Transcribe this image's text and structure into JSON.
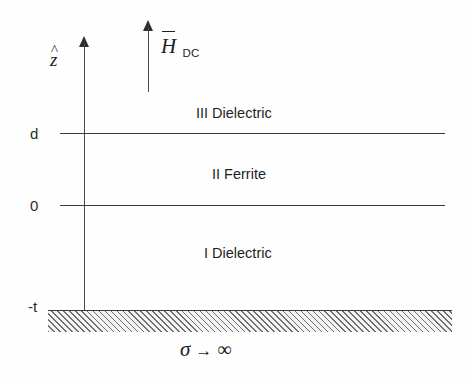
{
  "figure": {
    "type": "physics-layered-structure-diagram",
    "width": 470,
    "height": 381,
    "background_color": "#fefefe",
    "line_color": "#3a3a3a"
  },
  "axis": {
    "vertical_axis_symbol": "z",
    "vertical_axis_accent": "^",
    "vertical_axis_full": "ẑ",
    "direction": "up",
    "ticks": [
      {
        "label": "d",
        "meaning": "top ferrite interface"
      },
      {
        "label": "0",
        "meaning": "bottom ferrite interface"
      },
      {
        "label": "-t",
        "meaning": "conductor ground plane"
      }
    ]
  },
  "bias_field": {
    "symbol": "H",
    "overbar": true,
    "subscript": "DC",
    "full_label": "H̄ DC",
    "direction": "up",
    "description": "DC magnetic bias field arrow"
  },
  "regions": [
    {
      "numeral": "III",
      "material": "Dielectric",
      "label": "III Dielectric",
      "position": "above d"
    },
    {
      "numeral": "II",
      "material": "Ferrite",
      "label": "II Ferrite",
      "position": "between 0 and d"
    },
    {
      "numeral": "I",
      "material": "Dielectric",
      "label": "I Dielectric",
      "position": "between -t and 0"
    }
  ],
  "conductor": {
    "label_sigma": "σ",
    "label_arrow": "→",
    "label_infinity": "∞",
    "full_label": "σ → ∞",
    "description": "perfect electric conductor, hatched",
    "hatch_angle_deg": 45,
    "hatch_color": "#6f6f6f"
  },
  "interfaces": [
    {
      "name": "d-interface",
      "y_label": "d"
    },
    {
      "name": "zero-interface",
      "y_label": "0"
    }
  ]
}
